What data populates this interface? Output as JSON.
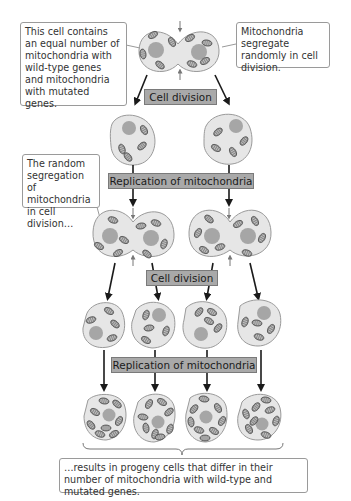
{
  "callouts": {
    "top_left": "This cell contains an equal number of mitochondria with wild-type genes and mitochondria with mutated genes.",
    "top_right": "Mitochondria segregate randomly in cell division.",
    "middle_left": "The random segregation of mitochondria in cell division…",
    "bottom": "…results in progeny cells that differ in their number of mitochondria with wild-type and mutated genes."
  },
  "stages": {
    "cell_division_1": "Cell division",
    "replication_1": "Replication of mitochondria",
    "cell_division_2": "Cell division",
    "replication_2": "Replication of mitochondria"
  },
  "colors": {
    "cell_fill": "#e6e6e6",
    "cell_stroke": "#9a9a9a",
    "nucleus": "#a6a6a6",
    "mito_fill": "#8a8a8a",
    "label_fill": "#a9a9a9",
    "arrow": "#1a1a1a"
  }
}
